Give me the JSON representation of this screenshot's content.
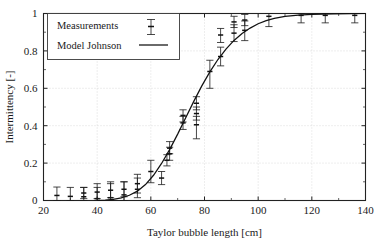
{
  "chart_data": {
    "type": "scatter",
    "title": "",
    "xlabel": "Taylor bubble length [cm]",
    "ylabel": "Intermittency [-]",
    "xlim": [
      20,
      140
    ],
    "ylim": [
      0,
      1
    ],
    "xticks": [
      20,
      40,
      60,
      80,
      100,
      120,
      140
    ],
    "yticks": [
      0,
      0.2,
      0.4,
      0.6,
      0.8,
      1
    ],
    "xtick_labels": [
      "20",
      "40",
      "60",
      "80",
      "100",
      "120",
      "140"
    ],
    "ytick_labels": [
      "0",
      "0.2",
      "0.4",
      "0.6",
      "0.8",
      "1"
    ],
    "grid": true,
    "legend_position": "top-left",
    "series": [
      {
        "name": "Measurements",
        "type": "errorbar",
        "marker": "errorbar-with-caps",
        "points": [
          {
            "x": 25,
            "y": 0.027,
            "yerr_low": 0.027,
            "yerr_high": 0.045
          },
          {
            "x": 30,
            "y": 0.022,
            "yerr_low": 0.022,
            "yerr_high": 0.048
          },
          {
            "x": 35,
            "y": 0.02,
            "yerr_low": 0.02,
            "yerr_high": 0.05
          },
          {
            "x": 35,
            "y": 0.04,
            "yerr_low": 0.03,
            "yerr_high": 0.03
          },
          {
            "x": 40,
            "y": 0.01,
            "yerr_low": 0.01,
            "yerr_high": 0.06
          },
          {
            "x": 40,
            "y": 0.045,
            "yerr_low": 0.035,
            "yerr_high": 0.045
          },
          {
            "x": 45,
            "y": 0.015,
            "yerr_low": 0.015,
            "yerr_high": 0.075
          },
          {
            "x": 45,
            "y": 0.055,
            "yerr_low": 0.04,
            "yerr_high": 0.045
          },
          {
            "x": 50,
            "y": 0.03,
            "yerr_low": 0.03,
            "yerr_high": 0.07
          },
          {
            "x": 50,
            "y": 0.06,
            "yerr_low": 0.04,
            "yerr_high": 0.04
          },
          {
            "x": 55,
            "y": 0.06,
            "yerr_low": 0.045,
            "yerr_high": 0.06
          },
          {
            "x": 55,
            "y": 0.09,
            "yerr_low": 0.05,
            "yerr_high": 0.05
          },
          {
            "x": 60,
            "y": 0.155,
            "yerr_low": 0.06,
            "yerr_high": 0.06
          },
          {
            "x": 64,
            "y": 0.12,
            "yerr_low": 0.035,
            "yerr_high": 0.035
          },
          {
            "x": 66,
            "y": 0.215,
            "yerr_low": 0.03,
            "yerr_high": 0.03
          },
          {
            "x": 67,
            "y": 0.25,
            "yerr_low": 0.035,
            "yerr_high": 0.035
          },
          {
            "x": 67,
            "y": 0.28,
            "yerr_low": 0.03,
            "yerr_high": 0.035
          },
          {
            "x": 72,
            "y": 0.415,
            "yerr_low": 0.035,
            "yerr_high": 0.035
          },
          {
            "x": 72,
            "y": 0.455,
            "yerr_low": 0.035,
            "yerr_high": 0.03
          },
          {
            "x": 77,
            "y": 0.405,
            "yerr_low": 0.075,
            "yerr_high": 0.045
          },
          {
            "x": 77,
            "y": 0.465,
            "yerr_low": 0.035,
            "yerr_high": 0.035
          },
          {
            "x": 77,
            "y": 0.52,
            "yerr_low": 0.035,
            "yerr_high": 0.035
          },
          {
            "x": 82,
            "y": 0.69,
            "yerr_low": 0.09,
            "yerr_high": 0.06
          },
          {
            "x": 86,
            "y": 0.77,
            "yerr_low": 0.05,
            "yerr_high": 0.05
          },
          {
            "x": 86,
            "y": 0.885,
            "yerr_low": 0.04,
            "yerr_high": 0.035
          },
          {
            "x": 91,
            "y": 0.895,
            "yerr_low": 0.045,
            "yerr_high": 0.045
          },
          {
            "x": 91,
            "y": 0.955,
            "yerr_low": 0.03,
            "yerr_high": 0.03
          },
          {
            "x": 95,
            "y": 0.91,
            "yerr_low": 0.055,
            "yerr_high": 0.05
          },
          {
            "x": 95,
            "y": 0.965,
            "yerr_low": 0.03,
            "yerr_high": 0.03
          },
          {
            "x": 104,
            "y": 0.985,
            "yerr_low": 0.055,
            "yerr_high": 0.015
          },
          {
            "x": 116,
            "y": 0.99,
            "yerr_low": 0.04,
            "yerr_high": 0.01
          },
          {
            "x": 125,
            "y": 0.99,
            "yerr_low": 0.04,
            "yerr_high": 0.01
          },
          {
            "x": 136,
            "y": 0.99,
            "yerr_low": 0.04,
            "yerr_high": 0.01
          }
        ]
      },
      {
        "name": "Model Johnson",
        "type": "line",
        "points": [
          {
            "x": 40.0,
            "y": 0.0
          },
          {
            "x": 43.0,
            "y": 0.002
          },
          {
            "x": 46.0,
            "y": 0.006
          },
          {
            "x": 49.0,
            "y": 0.014
          },
          {
            "x": 52.0,
            "y": 0.028
          },
          {
            "x": 55.0,
            "y": 0.05
          },
          {
            "x": 58.0,
            "y": 0.085
          },
          {
            "x": 61.0,
            "y": 0.135
          },
          {
            "x": 64.0,
            "y": 0.198
          },
          {
            "x": 67.0,
            "y": 0.272
          },
          {
            "x": 70.0,
            "y": 0.355
          },
          {
            "x": 73.0,
            "y": 0.443
          },
          {
            "x": 76.0,
            "y": 0.53
          },
          {
            "x": 79.0,
            "y": 0.613
          },
          {
            "x": 82.0,
            "y": 0.688
          },
          {
            "x": 85.0,
            "y": 0.754
          },
          {
            "x": 88.0,
            "y": 0.81
          },
          {
            "x": 91.0,
            "y": 0.856
          },
          {
            "x": 94.0,
            "y": 0.893
          },
          {
            "x": 97.0,
            "y": 0.922
          },
          {
            "x": 100.0,
            "y": 0.945
          },
          {
            "x": 103.0,
            "y": 0.962
          },
          {
            "x": 106.0,
            "y": 0.974
          },
          {
            "x": 110.0,
            "y": 0.984
          },
          {
            "x": 115.0,
            "y": 0.991
          },
          {
            "x": 120.0,
            "y": 0.995
          },
          {
            "x": 128.0,
            "y": 0.998
          },
          {
            "x": 140.0,
            "y": 1.0
          }
        ]
      }
    ]
  },
  "legend": {
    "entries": [
      {
        "label": "Measurements",
        "marker": "errorbar-sample"
      },
      {
        "label": "Model Johnson",
        "marker": "line-sample"
      }
    ]
  }
}
